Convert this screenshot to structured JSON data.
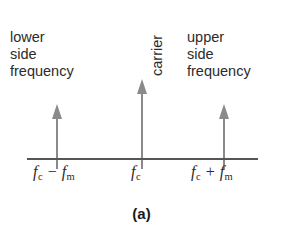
{
  "figure": {
    "caption": "(a)",
    "background_color": "#ffffff",
    "axis_color": "#555555",
    "arrow_color": "#8a8a8a",
    "text_color": "#2b2b2b"
  },
  "labels": {
    "lower": "lower\nside\nfrequency",
    "lower_lines": [
      "lower",
      "side",
      "frequency"
    ],
    "carrier": "carrier",
    "upper": "upper\nside\nfrequency",
    "upper_lines": [
      "upper",
      "side",
      "frequency"
    ]
  },
  "ticks": {
    "lower": {
      "symbol": "f",
      "sub": "c",
      "operator": "−",
      "symbol2": "f",
      "sub2": "m"
    },
    "center": {
      "symbol": "f",
      "sub": "c"
    },
    "upper": {
      "symbol": "f",
      "sub": "c",
      "operator": "+",
      "symbol2": "f",
      "sub2": "m"
    }
  },
  "chart_data": {
    "type": "bar",
    "title": "(a)",
    "subtitle": "",
    "xlabel": "",
    "ylabel": "",
    "grid": false,
    "legend_position": "none",
    "categories": [
      "f_c − f_m",
      "f_c",
      "f_c + f_m"
    ],
    "tick_labels": [
      "f_c − f_m",
      "f_c",
      "f_c + f_m"
    ],
    "values": [
      0.65,
      1.0,
      0.65
    ],
    "annotations": [
      "lower side frequency",
      "carrier",
      "upper side frequency"
    ],
    "series": [
      {
        "name": "amplitude spectrum",
        "values": [
          0.65,
          1.0,
          0.65
        ]
      }
    ],
    "ylim": [
      0,
      1.1
    ]
  }
}
